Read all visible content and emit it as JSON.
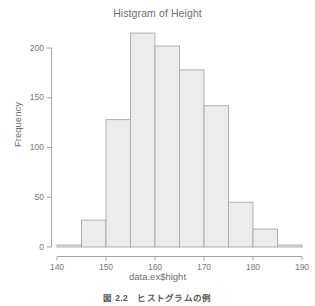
{
  "figure": {
    "title": "Histgram of Height",
    "caption": "図 2.2　ヒストグラムの例",
    "background_color": "#ffffff",
    "axis_color": "#9b9b9b",
    "text_color": "#6f6f6f"
  },
  "chart_data": {
    "type": "bar",
    "subtype": "histogram",
    "title": "Histgram of Height",
    "xlabel": "data.ex$hight",
    "ylabel": "Frequency",
    "xlim": [
      140,
      190
    ],
    "ylim": [
      0,
      215
    ],
    "grid": false,
    "legend": null,
    "bin_width": 5,
    "bin_edges": [
      140,
      145,
      150,
      155,
      160,
      165,
      170,
      175,
      180,
      185,
      190
    ],
    "categories": [
      "140-145",
      "145-150",
      "150-155",
      "155-160",
      "160-165",
      "165-170",
      "170-175",
      "175-180",
      "180-185",
      "185-190"
    ],
    "values": [
      2,
      27,
      128,
      215,
      202,
      178,
      142,
      45,
      18,
      2
    ],
    "bar_fill_color": "#ececec",
    "bar_border_color": "#a8a8a8",
    "xticks": [
      140,
      150,
      160,
      170,
      180,
      190
    ],
    "xtick_labels": [
      "140",
      "150",
      "160",
      "170",
      "180",
      "190"
    ],
    "yticks": [
      0,
      50,
      100,
      150,
      200
    ],
    "ytick_labels": [
      "0",
      "50",
      "100",
      "150",
      "200"
    ]
  }
}
